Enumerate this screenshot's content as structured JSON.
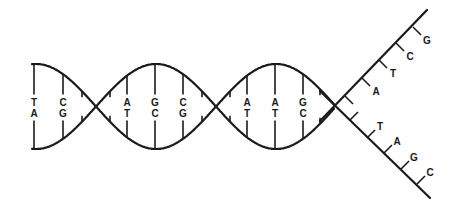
{
  "diagram": {
    "colors": {
      "stroke": "#1a1a1a",
      "background": "#ffffff"
    },
    "helix_pairs": [
      {
        "x": 34,
        "top": "T",
        "bottom": "A"
      },
      {
        "x": 63,
        "top": "C",
        "bottom": "G"
      },
      {
        "x": 127,
        "top": "A",
        "bottom": "T"
      },
      {
        "x": 155,
        "top": "G",
        "bottom": "C"
      },
      {
        "x": 183,
        "top": "C",
        "bottom": "G"
      },
      {
        "x": 247,
        "top": "A",
        "bottom": "T"
      },
      {
        "x": 275,
        "top": "A",
        "bottom": "T"
      },
      {
        "x": 303,
        "top": "G",
        "bottom": "C"
      }
    ],
    "upper_strand_bases": [
      "A",
      "T",
      "C",
      "G"
    ],
    "lower_strand_bases": [
      "T",
      "A",
      "G",
      "C"
    ]
  }
}
